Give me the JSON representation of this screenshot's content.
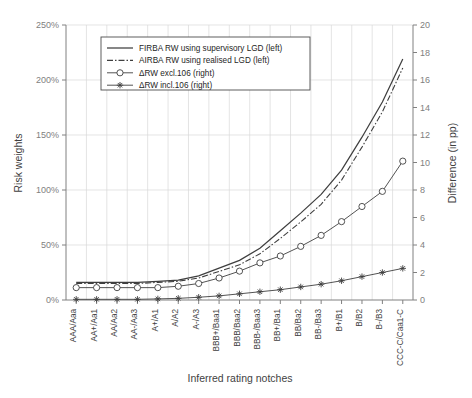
{
  "chart_data": {
    "type": "line",
    "title": "",
    "xlabel": "Inferred rating notches",
    "ylabel": "Risk weights",
    "y2label": "Difference (in pp)",
    "grid": true,
    "legend_position": "top-center-inside",
    "categories": [
      "AAA/Aaa",
      "AA+/Aa1",
      "AA/Aa2",
      "AA-/Aa3",
      "A+/A1",
      "A/A2",
      "A-/A3",
      "BBB+/Baa1",
      "BBB/Baa2",
      "BBB-/Baa3",
      "BB+/Ba1",
      "BB/Ba2",
      "BB-/Ba3",
      "B+/B1",
      "B/B2",
      "B-/B3",
      "CCC-C/Caa1-C"
    ],
    "ylim": [
      0,
      250
    ],
    "yticks": [
      0,
      50,
      100,
      150,
      200,
      250
    ],
    "ytick_labels": [
      "0%",
      "50%",
      "100%",
      "150%",
      "200%",
      "250%"
    ],
    "y2lim": [
      0,
      20
    ],
    "y2ticks": [
      0,
      2,
      4,
      6,
      8,
      10,
      12,
      14,
      16,
      18,
      20
    ],
    "y2tick_labels": [
      "0",
      "2",
      "4",
      "6",
      "8",
      "10",
      "12",
      "14",
      "16",
      "18",
      "20"
    ],
    "series": [
      {
        "name": "FIRBA RW using supervisory LGD (left)",
        "axis": "left",
        "style": "solid",
        "marker": "none",
        "color": "#3f3f3f",
        "values": [
          16,
          16,
          16,
          16,
          17,
          18,
          22,
          29,
          36,
          47,
          63,
          79,
          96,
          118,
          148,
          180,
          219
        ]
      },
      {
        "name": "AIRBA RW using realised LGD (left)",
        "axis": "left",
        "style": "dash-dot",
        "marker": "none",
        "color": "#3f3f3f",
        "values": [
          15,
          15,
          15,
          15,
          16,
          17,
          20,
          26,
          32,
          42,
          56,
          71,
          87,
          109,
          139,
          171,
          211
        ]
      },
      {
        "name": "ΔRW excl.106 (right)",
        "axis": "right",
        "style": "solid",
        "marker": "circle",
        "color": "#3f3f3f",
        "values": [
          0.9,
          0.9,
          0.9,
          0.9,
          0.9,
          1.0,
          1.2,
          1.6,
          2.1,
          2.7,
          3.2,
          3.9,
          4.7,
          5.7,
          6.8,
          7.9,
          10.1
        ]
      },
      {
        "name": "ΔRW incl.106 (right)",
        "axis": "right",
        "style": "solid",
        "marker": "star",
        "color": "#3f3f3f",
        "values": [
          0.05,
          0.05,
          0.05,
          0.05,
          0.08,
          0.12,
          0.2,
          0.3,
          0.45,
          0.6,
          0.75,
          0.95,
          1.15,
          1.4,
          1.7,
          2.0,
          2.3
        ]
      }
    ]
  },
  "legend": {
    "items": [
      {
        "label": "FIRBA RW using supervisory LGD (left)",
        "style": "solid",
        "marker": "none"
      },
      {
        "label": "AIRBA RW using realised LGD (left)",
        "style": "dash-dot",
        "marker": "none"
      },
      {
        "label": "ΔRW excl.106 (right)",
        "style": "solid",
        "marker": "circle"
      },
      {
        "label": "ΔRW incl.106 (right)",
        "style": "solid",
        "marker": "star"
      }
    ]
  },
  "axes": {
    "left_title": "Risk weights",
    "right_title": "Difference (in pp)",
    "bottom_title": "Inferred rating notches"
  }
}
